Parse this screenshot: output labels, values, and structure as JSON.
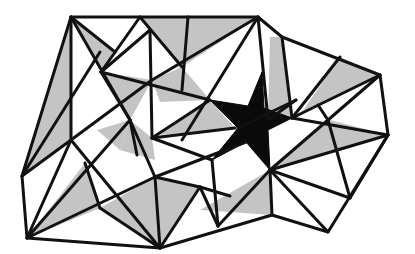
{
  "diagram": {
    "title": "",
    "colors": {
      "background": "#ffffff",
      "edge": "#111111",
      "shade": "#c4c4c4",
      "star": "#0a0a0a"
    },
    "vertices": {
      "A": [
        71,
        17
      ],
      "B": [
        140,
        17
      ],
      "C": [
        258,
        17
      ],
      "D": [
        282,
        37
      ],
      "E": [
        380,
        75
      ],
      "F": [
        388,
        135
      ],
      "G": [
        328,
        232
      ],
      "H": [
        272,
        215
      ],
      "I": [
        160,
        248
      ],
      "J": [
        27,
        238
      ],
      "K": [
        22,
        176
      ],
      "L": [
        101,
        72
      ],
      "M": [
        152,
        32
      ],
      "N": [
        182,
        67
      ],
      "O": [
        170,
        42
      ],
      "P": [
        120,
        150
      ],
      "Q": [
        152,
        138
      ],
      "R": [
        107,
        210
      ],
      "S": [
        85,
        163
      ],
      "T": [
        155,
        187
      ],
      "U": [
        200,
        197
      ],
      "V": [
        330,
        120
      ],
      "W": [
        270,
        170
      ],
      "X": [
        316,
        193
      ],
      "Y": [
        298,
        88
      ],
      "Z": [
        352,
        118
      ]
    },
    "star": {
      "points": [
        [
          262,
          72
        ],
        [
          246,
          108
        ],
        [
          210,
          100
        ],
        [
          238,
          130
        ],
        [
          212,
          160
        ],
        [
          246,
          142
        ],
        [
          270,
          170
        ],
        [
          268,
          130
        ],
        [
          292,
          118
        ],
        [
          262,
          110
        ]
      ]
    },
    "labels": []
  }
}
